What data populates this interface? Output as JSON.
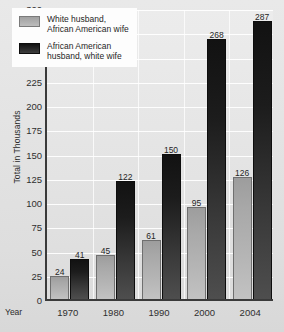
{
  "chart_data": {
    "type": "bar",
    "title": "",
    "xlabel": "Year",
    "ylabel": "Total in Thousands",
    "categories": [
      "1970",
      "1980",
      "1990",
      "2000",
      "2004"
    ],
    "series": [
      {
        "name": "White husband,\nAfrican American wife",
        "color": "#b0b0b0",
        "values": [
          24,
          45,
          61,
          95,
          126
        ]
      },
      {
        "name": "African American\nhusband, white wife",
        "color": "#1c1c1c",
        "values": [
          41,
          122,
          150,
          268,
          287
        ]
      }
    ],
    "ylim": [
      0,
      300
    ],
    "yticks": [
      0,
      25,
      50,
      75,
      100,
      125,
      150,
      175,
      200,
      225,
      250,
      275,
      300
    ],
    "ytick_labels": [
      "0",
      "25",
      "50",
      "75",
      "100",
      "125",
      "150",
      "175",
      "200",
      "225",
      "250",
      "275",
      "300"
    ],
    "grid": true,
    "legend_position": "top-left",
    "data_labels": [
      "24",
      "41",
      "45",
      "122",
      "61",
      "150",
      "95",
      "268",
      "126",
      "287"
    ]
  },
  "legend": {
    "items": [
      {
        "label": "White husband,\nAfrican American wife"
      },
      {
        "label": "African American\nhusband, white wife"
      }
    ]
  },
  "axes": {
    "y_title": "Total in Thousands",
    "x_title": "Year"
  }
}
